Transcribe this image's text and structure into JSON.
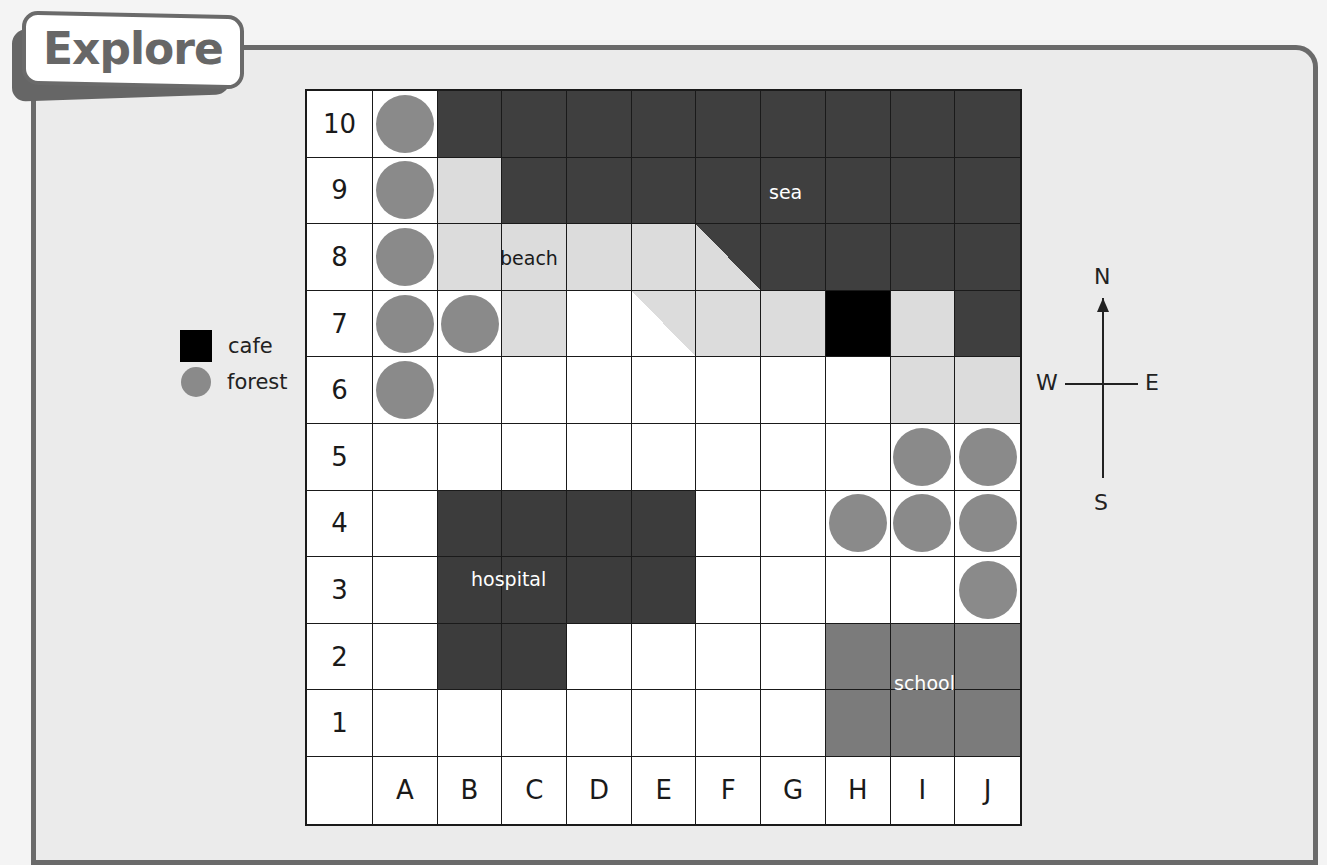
{
  "header": {
    "title": "Explore"
  },
  "legend": {
    "items": [
      {
        "label": "cafe",
        "symbol": "black-square",
        "color": "#000000"
      },
      {
        "label": "forest",
        "symbol": "gray-circle",
        "color": "#8a8a8a"
      }
    ]
  },
  "compass": {
    "north": "N",
    "south": "S",
    "east": "E",
    "west": "W"
  },
  "grid": {
    "columns": [
      "A",
      "B",
      "C",
      "D",
      "E",
      "F",
      "G",
      "H",
      "I",
      "J"
    ],
    "rows": [
      "10",
      "9",
      "8",
      "7",
      "6",
      "5",
      "4",
      "3",
      "2",
      "1"
    ],
    "colors": {
      "sea": "#3f3f3f",
      "beach": "#dcdcdc",
      "hospital": "#3c3c3c",
      "school": "#7b7b7b",
      "cafe": "#000000",
      "forest": "#8a8a8a"
    },
    "cells": {
      "10": [
        "forest",
        "sea",
        "sea",
        "sea",
        "sea",
        "sea",
        "sea",
        "sea",
        "sea",
        "sea"
      ],
      "9": [
        "forest",
        "beach",
        "sea",
        "sea",
        "sea",
        "sea",
        "sea",
        "sea",
        "sea",
        "sea"
      ],
      "8": [
        "forest",
        "beach",
        "beach",
        "beach",
        "beach",
        "beach-sea",
        "sea",
        "sea",
        "sea",
        "sea"
      ],
      "7": [
        "forest",
        "forest",
        "beach",
        "empty",
        "white-beach",
        "beach",
        "beach",
        "cafe",
        "beach",
        "sea"
      ],
      "6": [
        "forest",
        "empty",
        "empty",
        "empty",
        "empty",
        "empty",
        "empty",
        "empty",
        "beach",
        "beach"
      ],
      "5": [
        "empty",
        "empty",
        "empty",
        "empty",
        "empty",
        "empty",
        "empty",
        "empty",
        "forest",
        "forest"
      ],
      "4": [
        "empty",
        "hospital",
        "hospital",
        "hospital",
        "hospital",
        "empty",
        "empty",
        "forest",
        "forest",
        "forest"
      ],
      "3": [
        "empty",
        "hospital",
        "hospital",
        "hospital",
        "hospital",
        "empty",
        "empty",
        "empty",
        "empty",
        "forest"
      ],
      "2": [
        "empty",
        "hospital",
        "hospital",
        "empty",
        "empty",
        "empty",
        "empty",
        "school",
        "school",
        "school"
      ],
      "1": [
        "empty",
        "empty",
        "empty",
        "empty",
        "empty",
        "empty",
        "empty",
        "school",
        "school",
        "school"
      ]
    },
    "labels": [
      {
        "text": "sea",
        "x": 769,
        "y": 181,
        "color": "#ffffff"
      },
      {
        "text": "beach",
        "x": 500,
        "y": 247,
        "color": "#1a1a1a"
      },
      {
        "text": "hospital",
        "x": 471,
        "y": 568,
        "color": "#ffffff"
      },
      {
        "text": "school",
        "x": 894,
        "y": 672,
        "color": "#ffffff"
      }
    ]
  }
}
